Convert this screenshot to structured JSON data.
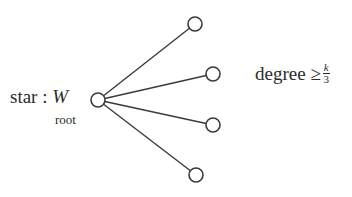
{
  "diagram": {
    "type": "star-graph",
    "labels": {
      "star_prefix": "star : ",
      "star_var": "W",
      "root_subscript": "root",
      "degree_text": "degree ≥ ",
      "frac_num": "k",
      "frac_den": "3"
    },
    "nodes": [
      {
        "id": "root",
        "x": 98,
        "y": 100,
        "r": 7
      },
      {
        "id": "leaf1",
        "x": 195,
        "y": 24,
        "r": 7
      },
      {
        "id": "leaf2",
        "x": 213,
        "y": 74,
        "r": 7
      },
      {
        "id": "leaf3",
        "x": 213,
        "y": 125,
        "r": 7
      },
      {
        "id": "leaf4",
        "x": 196,
        "y": 175,
        "r": 7
      }
    ],
    "edges": [
      {
        "from": "root",
        "to": "leaf1"
      },
      {
        "from": "root",
        "to": "leaf2"
      },
      {
        "from": "root",
        "to": "leaf3"
      },
      {
        "from": "root",
        "to": "leaf4"
      }
    ],
    "colors": {
      "stroke": "#3a3a3a",
      "text": "#2b2b2b",
      "background": "#ffffff"
    }
  }
}
